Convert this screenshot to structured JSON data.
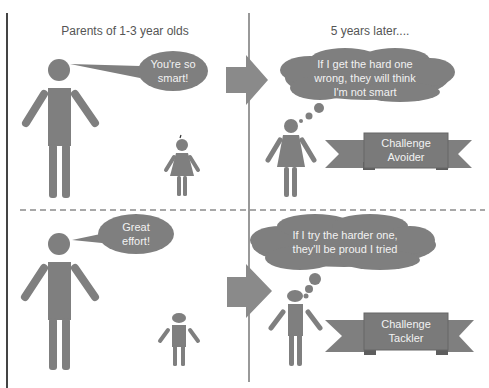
{
  "headings": {
    "left": "Parents of 1-3 year olds",
    "right": "5 years later...."
  },
  "top_row": {
    "speech": {
      "line1": "You're so",
      "line2": "smart!"
    },
    "thought": {
      "line1": "If I get the hard one",
      "line2": "wrong, they will think",
      "line3": "I'm not smart"
    },
    "banner": {
      "line1": "Challenge",
      "line2": "Avoider"
    }
  },
  "bottom_row": {
    "speech": {
      "line1": "Great",
      "line2": "effort!"
    },
    "thought": {
      "line1": "If I try the harder one,",
      "line2": "they'll be proud I tried"
    },
    "banner": {
      "line1": "Challenge",
      "line2": "Tackler"
    }
  },
  "colors": {
    "figure": "#7f7f7f",
    "banner_dark": "#6d6d6d",
    "line": "#555555",
    "dash": "#8c8c8c"
  }
}
